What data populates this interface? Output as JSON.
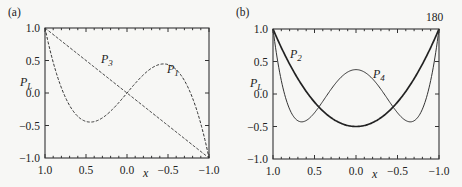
{
  "page_number": "180",
  "chart_data": [
    {
      "type": "line",
      "panel_label": "(a)",
      "title": "",
      "xlabel": "x",
      "ylabel": "P_L",
      "xlim": [
        1.0,
        -1.0
      ],
      "ylim": [
        -1.0,
        1.0
      ],
      "xticks": [
        "1.0",
        "0.5",
        "0.0",
        "-0.5",
        "-1.0"
      ],
      "yticks": [
        "1.0",
        "0.5",
        "0.0",
        "-0.5",
        "-1.0"
      ],
      "grid": false,
      "series": [
        {
          "name": "P1",
          "label": "P",
          "subscript": "1",
          "formula": "x",
          "style": "dashed",
          "x": [
            1.0,
            0.5,
            0.0,
            -0.5,
            -1.0
          ],
          "values": [
            1.0,
            0.5,
            0.0,
            -0.5,
            -1.0
          ]
        },
        {
          "name": "P3",
          "label": "P",
          "subscript": "3",
          "formula": "(5x^3-3x)/2",
          "style": "dashed",
          "x": [
            1.0,
            0.8,
            0.6,
            0.447,
            0.3,
            0.0,
            -0.3,
            -0.447,
            -0.6,
            -0.8,
            -1.0
          ],
          "values": [
            1.0,
            0.08,
            -0.36,
            -0.447,
            -0.383,
            0.0,
            0.383,
            0.447,
            0.36,
            -0.08,
            -1.0
          ]
        }
      ]
    },
    {
      "type": "line",
      "panel_label": "(b)",
      "title": "",
      "xlabel": "x",
      "ylabel": "P_L",
      "xlim": [
        1.0,
        -1.0
      ],
      "ylim": [
        -1.0,
        1.0
      ],
      "xticks": [
        "1.0",
        "0.5",
        "0.0",
        "-0.5",
        "-1.0"
      ],
      "yticks": [
        "1.0",
        "0.5",
        "0.0",
        "-0.5",
        "-1.0"
      ],
      "grid": false,
      "series": [
        {
          "name": "P2",
          "label": "P",
          "subscript": "2",
          "formula": "(3x^2-1)/2",
          "style": "solid-bold",
          "x": [
            1.0,
            0.75,
            0.5,
            0.25,
            0.0,
            -0.25,
            -0.5,
            -0.75,
            -1.0
          ],
          "values": [
            1.0,
            0.344,
            -0.125,
            -0.406,
            -0.5,
            -0.406,
            -0.125,
            0.344,
            1.0
          ]
        },
        {
          "name": "P4",
          "label": "P",
          "subscript": "4",
          "formula": "(35x^4-30x^2+3)/8",
          "style": "solid-thin",
          "x": [
            1.0,
            0.8,
            0.655,
            0.5,
            0.25,
            0.0,
            -0.25,
            -0.5,
            -0.655,
            -0.8,
            -1.0
          ],
          "values": [
            1.0,
            -0.233,
            -0.429,
            -0.289,
            0.232,
            0.375,
            0.232,
            -0.289,
            -0.429,
            -0.233,
            1.0
          ]
        }
      ]
    }
  ],
  "labels": {
    "a": {
      "panel": "(a)",
      "ylabel_main": "P",
      "ylabel_sub": "L",
      "xlabel": "x",
      "p3_main": "P",
      "p3_sub": "3",
      "p1_main": "P",
      "p1_sub": "1"
    },
    "b": {
      "panel": "(b)",
      "ylabel_main": "P",
      "ylabel_sub": "L",
      "xlabel": "x",
      "p2_main": "P",
      "p2_sub": "2",
      "p4_main": "P",
      "p4_sub": "4"
    },
    "ticks": [
      "1.0",
      "0.5",
      "0.0",
      "−0.5",
      "−1.0"
    ]
  }
}
